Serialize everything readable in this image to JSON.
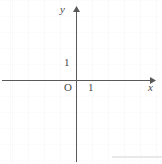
{
  "figure": {
    "kind": "cartesian-coordinate-plane",
    "width": 162,
    "height": 164,
    "background_color": "#ffffff",
    "grid": {
      "visible": true,
      "spacing_px": 16,
      "color": "#fafafb"
    },
    "axes": {
      "color": "#595959",
      "origin_px": {
        "x": 76,
        "y": 80
      },
      "unit_px": 16,
      "x_axis": {
        "label": "x",
        "from_px": {
          "x": 2,
          "y": 80
        },
        "to_px": {
          "x": 152,
          "y": 80
        },
        "arrow": "right"
      },
      "y_axis": {
        "label": "y",
        "from_px": {
          "x": 76,
          "y": 160
        },
        "to_px": {
          "x": 76,
          "y": 8
        },
        "arrow": "up"
      }
    },
    "labels": {
      "y_axis_name": "y",
      "x_axis_name": "x",
      "origin": "O",
      "x_unit_tick": "1",
      "y_unit_tick": "1"
    },
    "bottom_rule": {
      "visible": true,
      "color": "#e9e9ec"
    }
  }
}
